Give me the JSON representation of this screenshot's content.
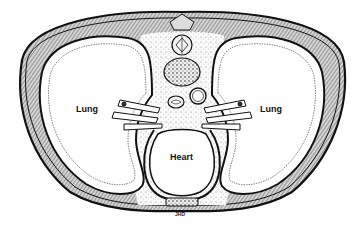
{
  "diagram": {
    "labels": {
      "left_lung": "Lung",
      "right_lung": "Lung",
      "heart": "Heart"
    },
    "signature": "JHD",
    "colors": {
      "ink": "#111111",
      "hatch": "#555555",
      "background": "#ffffff"
    }
  }
}
